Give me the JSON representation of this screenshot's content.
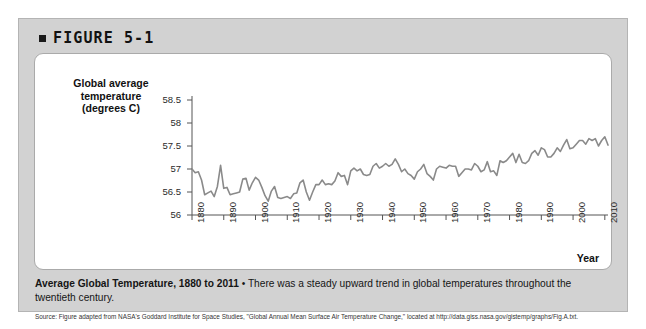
{
  "figure": {
    "bullet_icon": "square-bullet-icon",
    "label": "FIGURE 5-1"
  },
  "caption": {
    "title": "Average Global Temperature, 1880 to 2011",
    "separator": " • ",
    "body": "There was a steady upward trend in global temperatures throughout the twentieth century.",
    "source": "Source: Figure adapted from NASA's Goddard Institute for Space Studies, \"Global Annual Mean Surface Air Temperature Change,\" located at http://data.giss.nasa.gov/gistemp/graphs/Fig.A.txt."
  },
  "chart_data": {
    "type": "line",
    "title": "Average Global Temperature, 1880 to 2011",
    "xlabel": "Year",
    "ylabel": "Global average temperature (degrees C)",
    "ylabel_lines": [
      "Global average",
      "temperature",
      "(degrees C)"
    ],
    "xlim": [
      1880,
      2011
    ],
    "ylim": [
      56,
      58.5
    ],
    "yticks": [
      56,
      56.5,
      57,
      57.5,
      58,
      58.5
    ],
    "ytick_labels": [
      "56",
      "56.5",
      "57",
      "57.5",
      "58",
      "58.5"
    ],
    "xticks": [
      1880,
      1890,
      1900,
      1910,
      1920,
      1930,
      1940,
      1950,
      1960,
      1970,
      1980,
      1990,
      2000,
      2010
    ],
    "xtick_labels": [
      "1880",
      "1890",
      "1900",
      "1910",
      "1920",
      "1930",
      "1940",
      "1950",
      "1960",
      "1970",
      "1980",
      "1990",
      "2000",
      "2010"
    ],
    "grid": false,
    "legend": false,
    "line_color": "#8a8a8a",
    "line_width": 1.6,
    "series": [
      {
        "name": "Global average temperature",
        "x": [
          1880,
          1881,
          1882,
          1883,
          1884,
          1885,
          1886,
          1887,
          1888,
          1889,
          1890,
          1891,
          1892,
          1893,
          1894,
          1895,
          1896,
          1897,
          1898,
          1899,
          1900,
          1901,
          1902,
          1903,
          1904,
          1905,
          1906,
          1907,
          1908,
          1909,
          1910,
          1911,
          1912,
          1913,
          1914,
          1915,
          1916,
          1917,
          1918,
          1919,
          1920,
          1921,
          1922,
          1923,
          1924,
          1925,
          1926,
          1927,
          1928,
          1929,
          1930,
          1931,
          1932,
          1933,
          1934,
          1935,
          1936,
          1937,
          1938,
          1939,
          1940,
          1941,
          1942,
          1943,
          1944,
          1945,
          1946,
          1947,
          1948,
          1949,
          1950,
          1951,
          1952,
          1953,
          1954,
          1955,
          1956,
          1957,
          1958,
          1959,
          1960,
          1961,
          1962,
          1963,
          1964,
          1965,
          1966,
          1967,
          1968,
          1969,
          1970,
          1971,
          1972,
          1973,
          1974,
          1975,
          1976,
          1977,
          1978,
          1979,
          1980,
          1981,
          1982,
          1983,
          1984,
          1985,
          1986,
          1987,
          1988,
          1989,
          1990,
          1991,
          1992,
          1993,
          1994,
          1995,
          1996,
          1997,
          1998,
          1999,
          2000,
          2001,
          2002,
          2003,
          2004,
          2005,
          2006,
          2007,
          2008,
          2009,
          2010,
          2011
        ],
        "values": [
          57.0,
          56.92,
          56.94,
          56.76,
          56.44,
          56.48,
          56.52,
          56.4,
          56.62,
          57.08,
          56.58,
          56.6,
          56.44,
          56.46,
          56.48,
          56.5,
          56.78,
          56.8,
          56.54,
          56.7,
          56.82,
          56.76,
          56.6,
          56.42,
          56.3,
          56.52,
          56.62,
          56.38,
          56.36,
          56.38,
          56.4,
          56.36,
          56.46,
          56.48,
          56.7,
          56.76,
          56.5,
          56.32,
          56.5,
          56.66,
          56.66,
          56.76,
          56.66,
          56.68,
          56.66,
          56.74,
          56.92,
          56.84,
          56.86,
          56.66,
          56.96,
          57.02,
          56.96,
          57.0,
          56.88,
          56.86,
          56.88,
          57.06,
          57.12,
          57.02,
          57.06,
          57.12,
          57.06,
          57.1,
          57.22,
          57.1,
          56.94,
          57.0,
          56.9,
          56.86,
          56.78,
          56.94,
          57.0,
          57.1,
          56.9,
          56.84,
          56.76,
          57.0,
          57.06,
          57.04,
          57.02,
          57.08,
          57.06,
          57.06,
          56.84,
          56.92,
          57.0,
          57.0,
          56.98,
          57.12,
          57.06,
          56.94,
          56.98,
          57.16,
          56.94,
          56.96,
          56.86,
          57.18,
          57.14,
          57.18,
          57.26,
          57.34,
          57.14,
          57.32,
          57.14,
          57.12,
          57.18,
          57.34,
          57.4,
          57.3,
          57.46,
          57.42,
          57.26,
          57.26,
          57.34,
          57.46,
          57.38,
          57.52,
          57.64,
          57.44,
          57.46,
          57.54,
          57.62,
          57.62,
          57.54,
          57.66,
          57.62,
          57.66,
          57.5,
          57.62,
          57.7,
          57.52
        ]
      }
    ]
  }
}
